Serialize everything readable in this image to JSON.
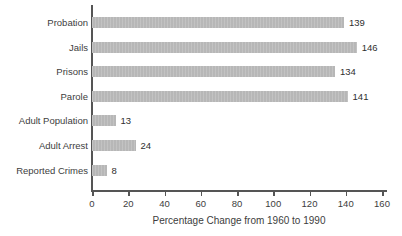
{
  "chart_data": {
    "type": "bar",
    "orientation": "horizontal",
    "title": "",
    "xlabel": "Percentage Change from 1960 to 1990",
    "ylabel": "",
    "categories": [
      "Probation",
      "Jails",
      "Prisons",
      "Parole",
      "Adult Population",
      "Adult Arrest",
      "Reported Crimes"
    ],
    "values": [
      139,
      146,
      134,
      141,
      13,
      24,
      8
    ],
    "value_labels": [
      "139",
      "146",
      "134",
      "141",
      "13",
      "24",
      "8"
    ],
    "xlim": [
      0,
      160
    ],
    "xticks": [
      0,
      20,
      40,
      60,
      80,
      100,
      120,
      140,
      160
    ],
    "xtick_labels": [
      "0",
      "20",
      "40",
      "60",
      "80",
      "100",
      "120",
      "140",
      "160"
    ],
    "grid": false,
    "legend": null,
    "bar_color": "#b7b7b7",
    "axis_color": "#555555",
    "text_color": "#3d3d3d",
    "background_color": "#ffffff"
  }
}
